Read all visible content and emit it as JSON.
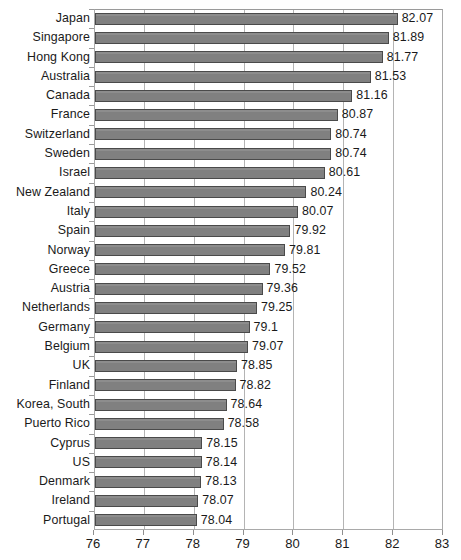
{
  "chart_data": {
    "type": "bar",
    "orientation": "horizontal",
    "title": "",
    "subtitle": "",
    "xlabel": "",
    "ylabel": "",
    "xlim": [
      76,
      83
    ],
    "xticks": [
      76,
      77,
      78,
      79,
      80,
      81,
      82,
      83
    ],
    "xtick_labels": [
      "76",
      "77",
      "78",
      "79",
      "80",
      "81",
      "82",
      "83"
    ],
    "grid": "vertical",
    "legend": "none",
    "bar_color": "#808080",
    "bar_border_color": "#4a4a4a",
    "categories": [
      "Japan",
      "Singapore",
      "Hong Kong",
      "Australia",
      "Canada",
      "France",
      "Switzerland",
      "Sweden",
      "Israel",
      "New Zealand",
      "Italy",
      "Spain",
      "Norway",
      "Greece",
      "Austria",
      "Netherlands",
      "Germany",
      "Belgium",
      "UK",
      "Finland",
      "Korea, South",
      "Puerto Rico",
      "Cyprus",
      "US",
      "Denmark",
      "Ireland",
      "Portugal"
    ],
    "values": [
      82.07,
      81.89,
      81.77,
      81.53,
      81.16,
      80.87,
      80.74,
      80.74,
      80.61,
      80.24,
      80.07,
      79.92,
      79.81,
      79.52,
      79.36,
      79.25,
      79.1,
      79.07,
      78.85,
      78.82,
      78.64,
      78.58,
      78.15,
      78.14,
      78.13,
      78.07,
      78.04
    ],
    "value_labels": [
      "82.07",
      "81.89",
      "81.77",
      "81.53",
      "81.16",
      "80.87",
      "80.74",
      "80.74",
      "80.61",
      "80.24",
      "80.07",
      "79.92",
      "79.81",
      "79.52",
      "79.36",
      "79.25",
      "79.1",
      "79.07",
      "78.85",
      "78.82",
      "78.64",
      "78.58",
      "78.15",
      "78.14",
      "78.13",
      "78.07",
      "78.04"
    ]
  }
}
